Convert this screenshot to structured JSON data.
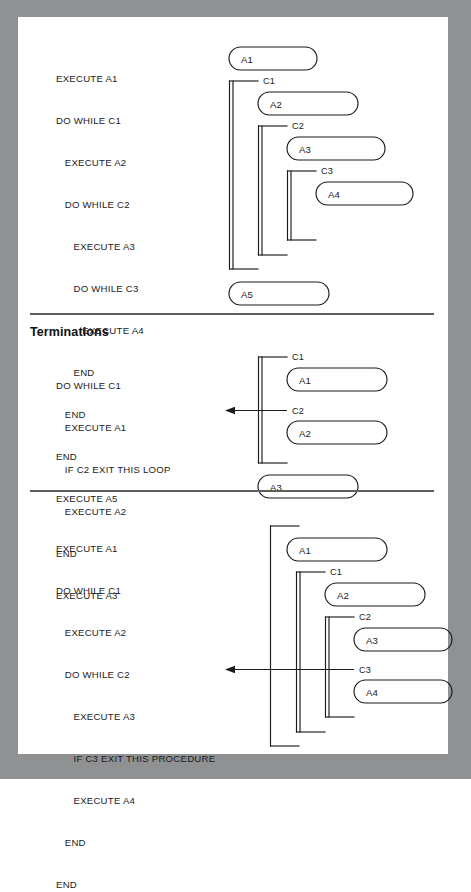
{
  "page": {
    "frame_color": "#8f9193",
    "sheet_color": "#ffffff",
    "ink_color": "#1b1b1b"
  },
  "panels": [
    {
      "id": "nesting",
      "heading": "",
      "code_lines": [
        "EXECUTE A1",
        "DO WHILE C1",
        "   EXECUTE A2",
        "   DO WHILE C2",
        "      EXECUTE A3",
        "      DO WHILE C3",
        "         EXECUTE A4",
        "      END",
        "   END",
        "END",
        "EXECUTE A5"
      ],
      "diagram": {
        "nodes": [
          "A1",
          "A2",
          "A3",
          "A4",
          "A5"
        ],
        "conditions": [
          "C1",
          "C2",
          "C3"
        ],
        "arrows": []
      }
    },
    {
      "id": "terminations",
      "heading": "Terminations",
      "code_lines": [
        "DO WHILE C1",
        "   EXECUTE A1",
        "   IF C2 EXIT THIS LOOP",
        "   EXECUTE A2",
        "END",
        "EXECUTE A3"
      ],
      "diagram": {
        "nodes": [
          "A1",
          "A2",
          "A3"
        ],
        "conditions": [
          "C1",
          "C2"
        ],
        "arrows": [
          "exit-this-loop"
        ]
      }
    },
    {
      "id": "procedure-exit",
      "heading": "",
      "code_lines": [
        "EXECUTE A1",
        "DO WHILE C1",
        "   EXECUTE A2",
        "   DO WHILE C2",
        "      EXECUTE A3",
        "      IF C3 EXIT THIS PROCEDURE",
        "      EXECUTE A4",
        "   END",
        "END"
      ],
      "diagram": {
        "nodes": [
          "A1",
          "A2",
          "A3",
          "A4"
        ],
        "conditions": [
          "C1",
          "C2",
          "C3"
        ],
        "arrows": [
          "exit-this-procedure"
        ]
      }
    }
  ]
}
